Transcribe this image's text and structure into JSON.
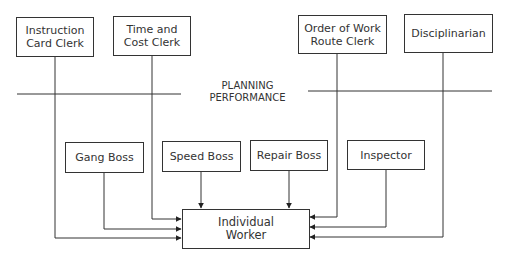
{
  "diagram": {
    "type": "organization-chart",
    "top_roles": [
      {
        "id": "instruction-card-clerk",
        "line1": "Instruction",
        "line2": "Card Clerk"
      },
      {
        "id": "time-and-cost-clerk",
        "line1": "Time and",
        "line2": "Cost Clerk"
      },
      {
        "id": "order-of-work-route-clerk",
        "line1": "Order of Work",
        "line2": "Route Clerk"
      },
      {
        "id": "disciplinarian",
        "line1": "Disciplinarian",
        "line2": ""
      }
    ],
    "divider": {
      "line1": "PLANNING",
      "line2": "PERFORMANCE"
    },
    "bosses": [
      {
        "id": "gang-boss",
        "label": "Gang Boss"
      },
      {
        "id": "speed-boss",
        "label": "Speed Boss"
      },
      {
        "id": "repair-boss",
        "label": "Repair Boss"
      },
      {
        "id": "inspector",
        "label": "Inspector"
      }
    ],
    "target": {
      "line1": "Individual",
      "line2": "Worker"
    },
    "edges": [
      {
        "from": "Instruction Card Clerk",
        "to": "Individual Worker"
      },
      {
        "from": "Time and Cost Clerk",
        "to": "Individual Worker"
      },
      {
        "from": "Order of Work Route Clerk",
        "to": "Individual Worker"
      },
      {
        "from": "Disciplinarian",
        "to": "Individual Worker"
      },
      {
        "from": "Gang Boss",
        "to": "Individual Worker"
      },
      {
        "from": "Speed Boss",
        "to": "Individual Worker"
      },
      {
        "from": "Repair Boss",
        "to": "Individual Worker"
      },
      {
        "from": "Inspector",
        "to": "Individual Worker"
      }
    ]
  }
}
